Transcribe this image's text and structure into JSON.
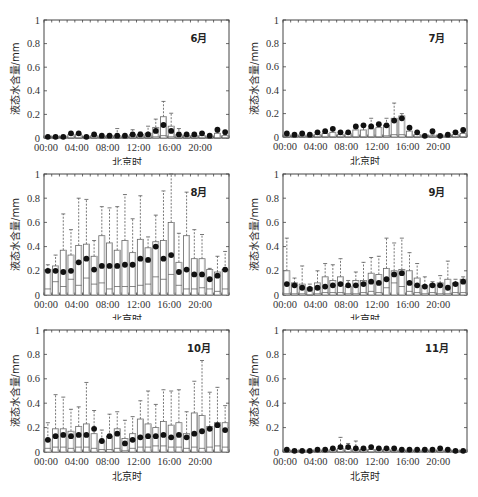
{
  "figure": {
    "ylabel": "液态水含量/mm",
    "xlabel": "北京时",
    "x_tick_labels": [
      "00:00",
      "04:00",
      "08:00",
      "12:00",
      "16:00",
      "20:00"
    ],
    "y_tick_labels": [
      "0",
      "0.2",
      "0.4",
      "0.6",
      "0.8",
      "1"
    ]
  },
  "chart_data": [
    {
      "type": "box",
      "title": "6月",
      "xlabel": "北京时",
      "ylabel": "液态水含量/mm",
      "ylim": [
        0,
        1
      ],
      "x": [
        0,
        1,
        2,
        3,
        4,
        5,
        6,
        7,
        8,
        9,
        10,
        11,
        12,
        13,
        14,
        15,
        16,
        17,
        18,
        19,
        20,
        21,
        22,
        23
      ],
      "mean": [
        0.01,
        0.01,
        0.01,
        0.04,
        0.04,
        0.01,
        0.03,
        0.02,
        0.02,
        0.02,
        0.02,
        0.03,
        0.03,
        0.03,
        0.06,
        0.11,
        0.06,
        0.03,
        0.03,
        0.03,
        0.04,
        0.02,
        0.07,
        0.05
      ],
      "q1": [
        0,
        0,
        0,
        0,
        0,
        0,
        0,
        0,
        0,
        0,
        0,
        0,
        0,
        0,
        0.01,
        0.02,
        0.01,
        0,
        0,
        0,
        0,
        0,
        0,
        0
      ],
      "q3": [
        0.01,
        0.01,
        0.01,
        0.03,
        0.03,
        0.01,
        0.02,
        0.01,
        0.02,
        0.02,
        0.01,
        0.03,
        0.03,
        0.04,
        0.09,
        0.18,
        0.1,
        0.03,
        0.02,
        0.02,
        0.02,
        0.01,
        0.04,
        0.02
      ],
      "whisker_high": [
        0.01,
        0.01,
        0.01,
        0.04,
        0.04,
        0.01,
        0.03,
        0.02,
        0.02,
        0.08,
        0.02,
        0.07,
        0.05,
        0.1,
        0.16,
        0.31,
        0.21,
        0.08,
        0.03,
        0.03,
        0.03,
        0.02,
        0.05,
        0.03
      ]
    },
    {
      "type": "box",
      "title": "7月",
      "xlabel": "北京时",
      "ylabel": "液态水含量/mm",
      "ylim": [
        0,
        1
      ],
      "x": [
        0,
        1,
        2,
        3,
        4,
        5,
        6,
        7,
        8,
        9,
        10,
        11,
        12,
        13,
        14,
        15,
        16,
        17,
        18,
        19,
        20,
        21,
        22,
        23
      ],
      "mean": [
        0.03,
        0.02,
        0.03,
        0.02,
        0.04,
        0.05,
        0.07,
        0.04,
        0.04,
        0.09,
        0.1,
        0.09,
        0.11,
        0.1,
        0.14,
        0.16,
        0.08,
        0.04,
        0.01,
        0.05,
        0.01,
        0.02,
        0.04,
        0.06
      ],
      "q1": [
        0,
        0,
        0,
        0,
        0,
        0,
        0,
        0,
        0,
        0,
        0,
        0,
        0,
        0.01,
        0.02,
        0.02,
        0,
        0,
        0,
        0,
        0,
        0,
        0,
        0
      ],
      "q3": [
        0.01,
        0.01,
        0.01,
        0.01,
        0.02,
        0.03,
        0.04,
        0.02,
        0.03,
        0.06,
        0.06,
        0.07,
        0.08,
        0.1,
        0.16,
        0.18,
        0.05,
        0.02,
        0.01,
        0.01,
        0.01,
        0.01,
        0.02,
        0.03
      ],
      "whisker_high": [
        0.02,
        0.01,
        0.02,
        0.01,
        0.03,
        0.04,
        0.06,
        0.03,
        0.04,
        0.09,
        0.09,
        0.16,
        0.12,
        0.16,
        0.29,
        0.2,
        0.08,
        0.04,
        0.01,
        0.02,
        0.01,
        0.01,
        0.03,
        0.04
      ]
    },
    {
      "type": "box",
      "title": "8月",
      "xlabel": "北京时",
      "ylabel": "液态水含量/mm",
      "ylim": [
        0,
        1
      ],
      "x": [
        0,
        1,
        2,
        3,
        4,
        5,
        6,
        7,
        8,
        9,
        10,
        11,
        12,
        13,
        14,
        15,
        16,
        17,
        18,
        19,
        20,
        21,
        22,
        23
      ],
      "mean": [
        0.2,
        0.2,
        0.19,
        0.2,
        0.27,
        0.3,
        0.21,
        0.24,
        0.24,
        0.24,
        0.25,
        0.25,
        0.3,
        0.29,
        0.4,
        0.3,
        0.33,
        0.19,
        0.21,
        0.17,
        0.17,
        0.13,
        0.16,
        0.21
      ],
      "q1": [
        0.05,
        0.11,
        0.07,
        0.13,
        0.08,
        0.14,
        0.09,
        0.1,
        0.05,
        0.07,
        0.07,
        0.07,
        0.08,
        0.09,
        0.15,
        0.13,
        0.17,
        0.08,
        0.05,
        0.05,
        0.06,
        0.05,
        0.03,
        0.05
      ],
      "q3": [
        0.21,
        0.24,
        0.37,
        0.33,
        0.41,
        0.42,
        0.32,
        0.49,
        0.43,
        0.37,
        0.45,
        0.35,
        0.46,
        0.39,
        0.44,
        0.45,
        0.6,
        0.27,
        0.49,
        0.3,
        0.3,
        0.21,
        0.19,
        0.21
      ],
      "whisker_high": [
        0.25,
        0.33,
        0.67,
        0.54,
        0.8,
        0.79,
        0.45,
        0.73,
        0.72,
        0.73,
        0.83,
        0.63,
        0.82,
        0.48,
        0.66,
        0.86,
        1.0,
        0.51,
        0.85,
        0.54,
        0.5,
        0.22,
        0.32,
        0.36
      ]
    },
    {
      "type": "box",
      "title": "9月",
      "xlabel": "北京时",
      "ylabel": "液态水含量/mm",
      "ylim": [
        0,
        1
      ],
      "x": [
        0,
        1,
        2,
        3,
        4,
        5,
        6,
        7,
        8,
        9,
        10,
        11,
        12,
        13,
        14,
        15,
        16,
        17,
        18,
        19,
        20,
        21,
        22,
        23
      ],
      "mean": [
        0.09,
        0.08,
        0.06,
        0.05,
        0.06,
        0.07,
        0.08,
        0.09,
        0.08,
        0.08,
        0.09,
        0.11,
        0.1,
        0.13,
        0.17,
        0.18,
        0.1,
        0.08,
        0.07,
        0.08,
        0.08,
        0.06,
        0.09,
        0.11
      ],
      "q1": [
        0.01,
        0.01,
        0.01,
        0,
        0.01,
        0.02,
        0.02,
        0.02,
        0.01,
        0.01,
        0.02,
        0.03,
        0.02,
        0.06,
        0.1,
        0.07,
        0.03,
        0.02,
        0.01,
        0.02,
        0.01,
        0.01,
        0.02,
        0.02
      ],
      "q3": [
        0.2,
        0.1,
        0.09,
        0.06,
        0.1,
        0.15,
        0.12,
        0.15,
        0.07,
        0.12,
        0.12,
        0.18,
        0.17,
        0.22,
        0.2,
        0.21,
        0.2,
        0.14,
        0.08,
        0.09,
        0.1,
        0.13,
        0.1,
        0.13
      ],
      "whisker_high": [
        0.47,
        0.14,
        0.24,
        0.09,
        0.2,
        0.26,
        0.25,
        0.3,
        0.12,
        0.19,
        0.27,
        0.31,
        0.32,
        0.47,
        0.43,
        0.47,
        0.35,
        0.26,
        0.15,
        0.11,
        0.16,
        0.28,
        0.13,
        0.15
      ]
    },
    {
      "type": "box",
      "title": "10月",
      "xlabel": "北京时",
      "ylabel": "液态水含量/mm",
      "ylim": [
        0,
        1
      ],
      "x": [
        0,
        1,
        2,
        3,
        4,
        5,
        6,
        7,
        8,
        9,
        10,
        11,
        12,
        13,
        14,
        15,
        16,
        17,
        18,
        19,
        20,
        21,
        22,
        23
      ],
      "mean": [
        0.1,
        0.13,
        0.14,
        0.13,
        0.14,
        0.14,
        0.19,
        0.09,
        0.13,
        0.15,
        0.07,
        0.1,
        0.12,
        0.13,
        0.13,
        0.14,
        0.12,
        0.14,
        0.12,
        0.15,
        0.17,
        0.19,
        0.22,
        0.18
      ],
      "q1": [
        0.03,
        0.04,
        0.04,
        0.03,
        0.04,
        0.04,
        0.03,
        0.02,
        0.02,
        0.03,
        0.01,
        0.03,
        0.04,
        0.04,
        0.05,
        0.05,
        0.04,
        0.04,
        0.03,
        0.04,
        0.03,
        0.04,
        0.05,
        0.04
      ],
      "q3": [
        0.1,
        0.19,
        0.19,
        0.17,
        0.21,
        0.23,
        0.15,
        0.09,
        0.13,
        0.19,
        0.11,
        0.15,
        0.27,
        0.23,
        0.2,
        0.25,
        0.22,
        0.24,
        0.15,
        0.32,
        0.3,
        0.21,
        0.24,
        0.24
      ],
      "whisker_high": [
        0.24,
        0.47,
        0.45,
        0.35,
        0.37,
        0.57,
        0.34,
        0.18,
        0.31,
        0.33,
        0.26,
        0.29,
        0.42,
        0.5,
        0.39,
        0.51,
        0.5,
        0.51,
        0.33,
        0.58,
        0.75,
        0.49,
        0.53,
        0.38
      ]
    },
    {
      "type": "box",
      "title": "11月",
      "xlabel": "北京时",
      "ylabel": "液态水含量/mm",
      "ylim": [
        0,
        1
      ],
      "x": [
        0,
        1,
        2,
        3,
        4,
        5,
        6,
        7,
        8,
        9,
        10,
        11,
        12,
        13,
        14,
        15,
        16,
        17,
        18,
        19,
        20,
        21,
        22,
        23
      ],
      "mean": [
        0.02,
        0.01,
        0.01,
        0.01,
        0.02,
        0.02,
        0.03,
        0.04,
        0.04,
        0.03,
        0.03,
        0.04,
        0.03,
        0.03,
        0.03,
        0.02,
        0.02,
        0.02,
        0.02,
        0.02,
        0.03,
        0.02,
        0.01,
        0.01
      ],
      "q1": [
        0,
        0,
        0,
        0,
        0,
        0,
        0,
        0,
        0,
        0,
        0,
        0,
        0,
        0,
        0,
        0,
        0,
        0,
        0,
        0,
        0,
        0,
        0,
        0
      ],
      "q3": [
        0.01,
        0.01,
        0.01,
        0.01,
        0.01,
        0.01,
        0.02,
        0.03,
        0.03,
        0.02,
        0.02,
        0.02,
        0.02,
        0.02,
        0.01,
        0.01,
        0.01,
        0.01,
        0.01,
        0.01,
        0.01,
        0.01,
        0.01,
        0.01
      ],
      "whisker_high": [
        0.02,
        0.01,
        0.01,
        0.01,
        0.02,
        0.02,
        0.03,
        0.12,
        0.07,
        0.09,
        0.03,
        0.04,
        0.03,
        0.03,
        0.02,
        0.02,
        0.02,
        0.02,
        0.02,
        0.02,
        0.03,
        0.02,
        0.01,
        0.01
      ]
    }
  ]
}
